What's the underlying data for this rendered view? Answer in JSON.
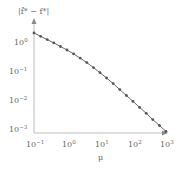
{
  "chart_data": {
    "type": "line",
    "title": "",
    "xlabel": "μ",
    "ylabel": "|f̂* − f*|",
    "xscale": "log",
    "yscale": "log",
    "xlim": [
      0.1,
      1000
    ],
    "ylim": [
      0.001,
      3
    ],
    "x_ticks": [
      "10^-1",
      "10^0",
      "10^1",
      "10^2",
      "10^3"
    ],
    "y_ticks": [
      "10^0",
      "10^-1",
      "10^-2",
      "10^-3"
    ],
    "grid": false,
    "legend": null,
    "series": [
      {
        "name": "error",
        "marker": "circle",
        "color": "#555555",
        "x": [
          0.1,
          0.158,
          0.251,
          0.398,
          0.631,
          1.0,
          1.585,
          2.512,
          3.981,
          6.31,
          10,
          15.85,
          25.12,
          39.81,
          63.1,
          100,
          158.5,
          251.2,
          398.1,
          631,
          1000
        ],
        "y": [
          2.0,
          1.55,
          1.2,
          0.93,
          0.71,
          0.54,
          0.4,
          0.29,
          0.205,
          0.14,
          0.095,
          0.063,
          0.041,
          0.026,
          0.0165,
          0.0105,
          0.0066,
          0.0042,
          0.0026,
          0.00165,
          0.00105
        ]
      }
    ]
  },
  "labels": {
    "ylabel": "|f̂* − f*|",
    "xlabel": "μ",
    "x_ticks": [
      {
        "base": "10",
        "exp": "−1"
      },
      {
        "base": "10",
        "exp": "0"
      },
      {
        "base": "10",
        "exp": "1"
      },
      {
        "base": "10",
        "exp": "2"
      },
      {
        "base": "10",
        "exp": "3"
      }
    ],
    "y_ticks": [
      {
        "base": "10",
        "exp": "0"
      },
      {
        "base": "10",
        "exp": "−1"
      },
      {
        "base": "10",
        "exp": "−2"
      },
      {
        "base": "10",
        "exp": "−3"
      }
    ]
  }
}
